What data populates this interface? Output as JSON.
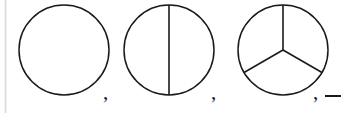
{
  "figure": {
    "background_color": "#ffffff",
    "stroke_color": "#1a1a1a",
    "margin_rule_color": "#d8d8d8",
    "width": 341,
    "height": 113,
    "circles": [
      {
        "index": 1,
        "label": "circle-one-part",
        "parts": 1,
        "cx": 64,
        "cy": 50,
        "r": 45,
        "spokes": [],
        "description": "Undivided circle, one whole"
      },
      {
        "index": 2,
        "label": "circle-two-parts",
        "parts": 2,
        "cx": 169,
        "cy": 50,
        "r": 45,
        "spokes": [
          90,
          270
        ],
        "description": "Circle split by a vertical diameter into two halves"
      },
      {
        "index": 3,
        "label": "circle-three-parts",
        "parts": 3,
        "cx": 283,
        "cy": 50,
        "r": 45,
        "spokes": [
          90,
          210,
          330
        ],
        "description": "Circle split by three radii into three equal thirds"
      }
    ],
    "separators": [
      {
        "name": "comma-1",
        "text": ",",
        "x": 103,
        "y": 82
      },
      {
        "name": "comma-2",
        "text": ",",
        "x": 211,
        "y": 82
      },
      {
        "name": "comma-3",
        "text": ",",
        "x": 313,
        "y": 82
      }
    ],
    "trailing_mark": {
      "name": "trailing-dash",
      "text": "—",
      "meaning": "sequence continues, clipped at right edge"
    }
  }
}
